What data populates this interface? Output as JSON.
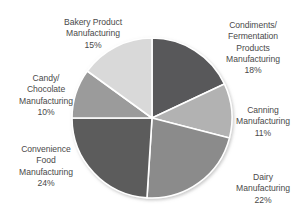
{
  "chart_data": {
    "type": "pie",
    "title": "",
    "subtitle": "",
    "xlabel": "",
    "ylabel": "",
    "legend_position": "none",
    "grid": false,
    "label_format": "name + percent",
    "start_angle_deg": 0,
    "direction": "clockwise",
    "units": "percent",
    "total": 100,
    "categories": [
      "Condiments/ Fermentation Products Manufacturing",
      "Canning Manufacturing",
      "Dairy Manufacturing",
      "Convenience Food Manufacturing",
      "Candy/ Chocolate Manufacturing",
      "Bakery Product Manufacturing"
    ],
    "values": [
      18,
      11,
      22,
      24,
      10,
      15
    ],
    "slices": [
      {
        "key": "condiments",
        "name": "Condiments/\nFermentation\nProducts\nManufacturing",
        "percent_label": "18%",
        "value": 18,
        "color": "#58585a",
        "start_angle_deg": 0,
        "end_angle_deg": 64.8
      },
      {
        "key": "canning",
        "name": "Canning\nManufacturing",
        "percent_label": "11%",
        "value": 11,
        "color": "#b2b2b2",
        "start_angle_deg": 64.8,
        "end_angle_deg": 104.4
      },
      {
        "key": "dairy",
        "name": "Dairy\nManufacturing",
        "percent_label": "22%",
        "value": 22,
        "color": "#8b8b8b",
        "start_angle_deg": 104.4,
        "end_angle_deg": 183.6
      },
      {
        "key": "convenience",
        "name": "Convenience\nFood\nManufacturing",
        "percent_label": "24%",
        "value": 24,
        "color": "#5c5c5c",
        "start_angle_deg": 183.6,
        "end_angle_deg": 270.0
      },
      {
        "key": "candy",
        "name": "Candy/\nChocolate\nManufacturing",
        "percent_label": "10%",
        "value": 10,
        "color": "#9b9b9b",
        "start_angle_deg": 270.0,
        "end_angle_deg": 306.0
      },
      {
        "key": "bakery",
        "name": "Bakery Product\nManufacturing",
        "percent_label": "15%",
        "value": 15,
        "color": "#d9d9d9",
        "start_angle_deg": 306.0,
        "end_angle_deg": 360.0
      }
    ],
    "colors": {
      "condiments": "#58585a",
      "canning": "#b2b2b2",
      "dairy": "#8b8b8b",
      "convenience": "#5c5c5c",
      "candy": "#9b9b9b",
      "bakery": "#d9d9d9",
      "separator": "#ffffff",
      "label_text": "#4a4a4a",
      "background": "#ffffff"
    },
    "geometry": {
      "center_x": 152,
      "center_y": 118,
      "radius": 80
    }
  }
}
